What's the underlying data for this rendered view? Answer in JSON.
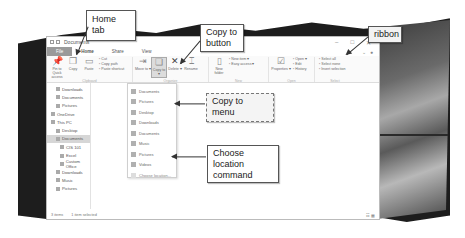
{
  "window": {
    "title": "Documents",
    "controls": [
      "–",
      "□",
      "✕"
    ]
  },
  "tabs": [
    {
      "label": "File",
      "active": false
    },
    {
      "label": "Home",
      "active": true
    },
    {
      "label": "Share",
      "active": false
    },
    {
      "label": "View",
      "active": false
    }
  ],
  "ribbon": {
    "clipboard": {
      "pin_label": "Pin to Quick access",
      "copy_label": "Copy",
      "paste_label": "Paste",
      "small": [
        "Cut",
        "Copy path",
        "Paste shortcut"
      ],
      "group_label": "Clipboard"
    },
    "organize": {
      "move_to_label": "Move to ▾",
      "copy_to_label": "Copy to ▾",
      "delete_label": "Delete ▾",
      "rename_label": "Rename",
      "group_label": "Organize"
    },
    "new": {
      "new_folder_label": "New folder",
      "small": [
        "New item ▾",
        "Easy access ▾"
      ],
      "group_label": "New"
    },
    "open": {
      "properties_label": "Properties ▾",
      "small": [
        "Open ▾",
        "Edit",
        "History"
      ],
      "group_label": "Open"
    },
    "select": {
      "small": [
        "Select all",
        "Select none",
        "Invert selection"
      ],
      "group_label": "Select"
    }
  },
  "nav": {
    "items": [
      {
        "label": "Downloads",
        "level": 1,
        "pinned": true
      },
      {
        "label": "Documents",
        "level": 1,
        "pinned": true
      },
      {
        "label": "Pictures",
        "level": 1,
        "pinned": true
      },
      {
        "label": "OneDrive",
        "level": 0
      },
      {
        "label": "This PC",
        "level": 0
      },
      {
        "label": "Desktop",
        "level": 1
      },
      {
        "label": "Documents",
        "level": 1,
        "selected": true
      },
      {
        "label": "CIS 101",
        "level": 2
      },
      {
        "label": "Excel",
        "level": 2
      },
      {
        "label": "Custom Office",
        "level": 2
      },
      {
        "label": "Downloads",
        "level": 1
      },
      {
        "label": "Music",
        "level": 1
      },
      {
        "label": "Pictures",
        "level": 1
      }
    ]
  },
  "copy_menu": {
    "items": [
      "Documents",
      "Pictures",
      "Desktop",
      "Downloads",
      "Documents",
      "Music",
      "Pictures",
      "Videos",
      "Choose location..."
    ]
  },
  "status": {
    "count": "3 items",
    "selected": "1 item selected",
    "views": "☷ ▦"
  },
  "callouts": {
    "home_tab": "Home tab",
    "copy_to_button": "Copy to button",
    "ribbon": "ribbon",
    "copy_to_menu": "Copy to menu",
    "choose_location": "Choose location command"
  }
}
